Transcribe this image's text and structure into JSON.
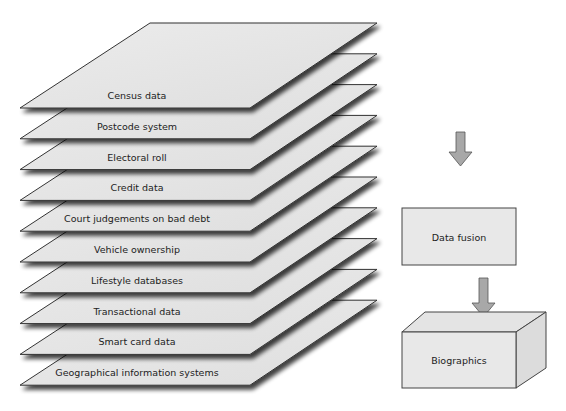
{
  "diagram": {
    "layers": [
      {
        "label": "Census data"
      },
      {
        "label": "Postcode system"
      },
      {
        "label": "Electoral roll"
      },
      {
        "label": "Credit data"
      },
      {
        "label": "Court judgements on bad debt"
      },
      {
        "label": "Vehicle ownership"
      },
      {
        "label": "Lifestyle databases"
      },
      {
        "label": "Transactional data"
      },
      {
        "label": "Smart card data"
      },
      {
        "label": "Geographical information systems"
      }
    ],
    "process_box": {
      "label": "Data fusion"
    },
    "output_box": {
      "label": "Biographics"
    },
    "flow": [
      "layers",
      "Data fusion",
      "Biographics"
    ],
    "colors": {
      "sheet_fill": "#e6e6e6",
      "sheet_stroke": "#333333",
      "arrow_fill": "#a8a8a8",
      "box_fill": "#e8e8e8"
    }
  }
}
